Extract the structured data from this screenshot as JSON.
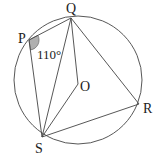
{
  "diagram": {
    "type": "circle-geometry",
    "circle": {
      "cx": 78,
      "cy": 80,
      "r": 64
    },
    "points": {
      "P": {
        "label": "P",
        "x": 29,
        "y": 40
      },
      "Q": {
        "label": "Q",
        "x": 71,
        "y": 18
      },
      "R": {
        "label": "R",
        "x": 139,
        "y": 104
      },
      "S": {
        "label": "S",
        "x": 42,
        "y": 137
      },
      "O": {
        "label": "O",
        "x": 78,
        "y": 84
      }
    },
    "segments": [
      "PQ",
      "PS",
      "QS",
      "QR",
      "QO",
      "OS",
      "RS"
    ],
    "angle_marker": {
      "vertex": "P",
      "value": "110°",
      "fill": "#b0b0b0"
    },
    "labels": {
      "P": "P",
      "Q": "Q",
      "R": "R",
      "S": "S",
      "O": "O",
      "angle_P": "110°"
    }
  }
}
